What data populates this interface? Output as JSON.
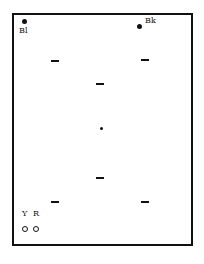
{
  "diagram": {
    "type": "pin-layout",
    "frame": {
      "stroke": "#111111",
      "background": "#ffffff"
    },
    "corner_markers": [
      {
        "id": "bl",
        "label": "Bl",
        "marker": "filled-dot"
      },
      {
        "id": "bk",
        "label": "Bk",
        "marker": "filled-dot"
      }
    ],
    "bottom_markers": [
      {
        "id": "y",
        "label": "Y",
        "marker": "open-circle"
      },
      {
        "id": "r",
        "label": "R",
        "marker": "open-circle"
      }
    ],
    "center_marker": {
      "marker": "small-filled-dot"
    },
    "dashes": [
      {
        "position": "upper-left"
      },
      {
        "position": "upper-right"
      },
      {
        "position": "upper-center"
      },
      {
        "position": "lower-center"
      },
      {
        "position": "lower-left"
      },
      {
        "position": "lower-right"
      }
    ]
  }
}
